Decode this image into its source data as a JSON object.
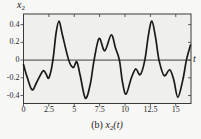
{
  "figure": {
    "ylabel": {
      "base": "x",
      "sub": "2"
    },
    "xlabel": "t",
    "caption": {
      "prefix": "(b) ",
      "base": "x",
      "sub": "2",
      "suffix": "(t)"
    }
  },
  "chart_data": {
    "type": "line",
    "title": "(b) x2(t)",
    "xlabel": "t",
    "ylabel": "x2",
    "xlim": [
      0,
      16.5
    ],
    "ylim": [
      -0.49,
      0.52
    ],
    "grid": false,
    "zero_line": true,
    "xticks": {
      "values": [
        0,
        2.5,
        5,
        7.5,
        10,
        12.5,
        15
      ],
      "labels": [
        "0",
        "2.5",
        "5",
        "7.5",
        "10",
        "12.5",
        "15"
      ]
    },
    "yticks": {
      "values": [
        -0.4,
        -0.2,
        0,
        0.2,
        0.4
      ],
      "labels": [
        "-0.4",
        "-0.2",
        "0",
        "0.2",
        "0.4"
      ]
    },
    "colors": {
      "line": "#1a1a1a",
      "frame": "#3a3a3a",
      "zero_line": "#2b2b2b",
      "plot_bg": "#efefec",
      "page_bg": "#f7f7f5"
    },
    "series": [
      {
        "name": "x2(t)",
        "points": [
          [
            0,
            -0.05
          ],
          [
            0.35,
            -0.19
          ],
          [
            0.85,
            -0.335
          ],
          [
            1.3,
            -0.25
          ],
          [
            1.9,
            -0.125
          ],
          [
            2.2,
            -0.15
          ],
          [
            2.5,
            -0.2
          ],
          [
            2.9,
            0.0
          ],
          [
            3.2,
            0.3
          ],
          [
            3.5,
            0.44
          ],
          [
            3.8,
            0.3
          ],
          [
            4.45,
            0.0
          ],
          [
            4.9,
            -0.085
          ],
          [
            5.25,
            -0.02
          ],
          [
            5.6,
            -0.18
          ],
          [
            6.1,
            -0.43
          ],
          [
            6.6,
            -0.26
          ],
          [
            6.95,
            0.0
          ],
          [
            7.45,
            0.245
          ],
          [
            8.0,
            0.105
          ],
          [
            8.65,
            0.285
          ],
          [
            9.05,
            0.14
          ],
          [
            9.45,
            0.0
          ],
          [
            9.75,
            -0.25
          ],
          [
            10.1,
            -0.385
          ],
          [
            10.6,
            -0.21
          ],
          [
            11.05,
            -0.1
          ],
          [
            11.5,
            -0.165
          ],
          [
            11.95,
            0.0
          ],
          [
            12.3,
            0.28
          ],
          [
            12.65,
            0.44
          ],
          [
            13.0,
            0.26
          ],
          [
            13.35,
            0.0
          ],
          [
            13.85,
            -0.175
          ],
          [
            14.4,
            -0.11
          ],
          [
            14.8,
            -0.22
          ],
          [
            15.2,
            -0.42
          ],
          [
            15.7,
            -0.22
          ],
          [
            16.05,
            0.0
          ],
          [
            16.45,
            0.17
          ]
        ]
      }
    ]
  }
}
